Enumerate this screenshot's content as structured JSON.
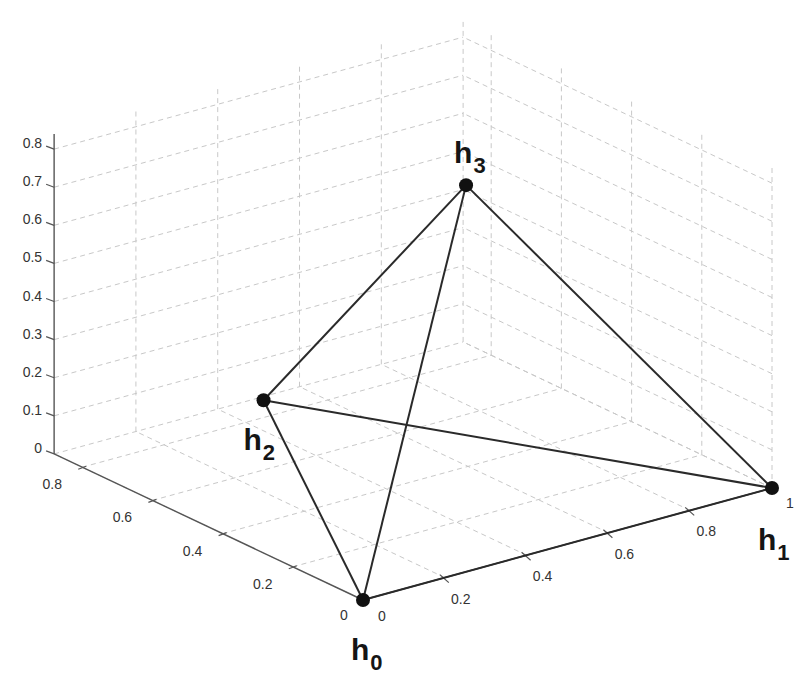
{
  "chart_data": {
    "type": "scatter3d",
    "title": "",
    "xlabel": "",
    "ylabel": "",
    "zlabel": "",
    "xlim": [
      0,
      1
    ],
    "ylim": [
      0,
      0.88
    ],
    "zlim": [
      0,
      0.84
    ],
    "grid": true,
    "legend": null,
    "x_ticks": [
      0,
      0.2,
      0.4,
      0.6,
      0.8,
      1
    ],
    "x_tick_labels": [
      "0",
      "0.2",
      "0.4",
      "0.6",
      "0.8",
      "1"
    ],
    "y_ticks": [
      0,
      0.2,
      0.4,
      0.6,
      0.8
    ],
    "y_tick_labels": [
      "0",
      "0.2",
      "0.4",
      "0.6",
      "0.8"
    ],
    "z_ticks": [
      0,
      0.1,
      0.2,
      0.3,
      0.4,
      0.5,
      0.6,
      0.7,
      0.8
    ],
    "z_tick_labels": [
      "0",
      "0.1",
      "0.2",
      "0.3",
      "0.4",
      "0.5",
      "0.6",
      "0.7",
      "0.8"
    ],
    "points": [
      {
        "name": "h0",
        "label": "h",
        "sub": "0",
        "x": 0,
        "y": 0,
        "z": 0
      },
      {
        "name": "h1",
        "label": "h",
        "sub": "1",
        "x": 1,
        "y": 0,
        "z": 0
      },
      {
        "name": "h2",
        "label": "h",
        "sub": "2",
        "x": 0.5,
        "y": 0.866,
        "z": 0
      },
      {
        "name": "h3",
        "label": "h",
        "sub": "3",
        "x": 0.5,
        "y": 0.289,
        "z": 0.816
      }
    ],
    "edges": [
      [
        0,
        1
      ],
      [
        0,
        2
      ],
      [
        0,
        3
      ],
      [
        1,
        2
      ],
      [
        1,
        3
      ],
      [
        2,
        3
      ]
    ],
    "annotations": [
      "tetrahedron with vertices h0, h1, h2, h3"
    ]
  },
  "colors": {
    "edge": "#2a2a2a",
    "vertex": "#111111",
    "grid": "#c8c8c8",
    "axis": "#555555"
  }
}
